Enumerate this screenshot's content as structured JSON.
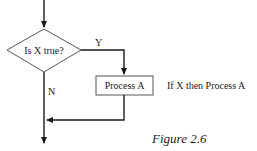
{
  "diagram": {
    "decision": {
      "label": "Is X true?"
    },
    "yes_label": "Y",
    "no_label": "N",
    "process": {
      "label": "Process A"
    },
    "annotation": "If X then Process A",
    "caption": "Figure 2.6",
    "colors": {
      "line": "#1a1a1a",
      "background": "#ffffff"
    }
  }
}
